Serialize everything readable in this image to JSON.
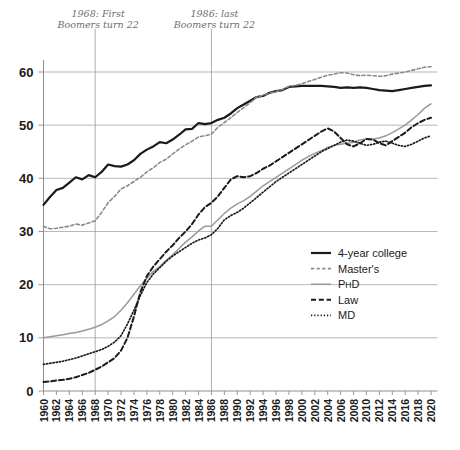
{
  "chart_data": {
    "type": "line",
    "title": "",
    "xlabel": "",
    "ylabel": "",
    "xlim": [
      1960,
      2021
    ],
    "ylim": [
      0,
      63
    ],
    "yticks": [
      0,
      10,
      20,
      30,
      40,
      50,
      60
    ],
    "grid": true,
    "legend_position": "center-right",
    "xticks": [
      1960,
      1962,
      1964,
      1966,
      1968,
      1970,
      1972,
      1974,
      1976,
      1978,
      1980,
      1982,
      1984,
      1986,
      1988,
      1990,
      1992,
      1994,
      1996,
      1998,
      2000,
      2002,
      2004,
      2006,
      2008,
      2010,
      2012,
      2014,
      2016,
      2018,
      2020
    ],
    "annotations": [
      {
        "text_line1": "1968: First",
        "text_line2": "Boomers turn 22",
        "x": 1968
      },
      {
        "text_line1": "1986: last",
        "text_line2": "Boomers turn 22",
        "x": 1986
      }
    ],
    "x": [
      1960,
      1961,
      1962,
      1963,
      1964,
      1965,
      1966,
      1967,
      1968,
      1969,
      1970,
      1971,
      1972,
      1973,
      1974,
      1975,
      1976,
      1977,
      1978,
      1979,
      1980,
      1981,
      1982,
      1983,
      1984,
      1985,
      1986,
      1987,
      1988,
      1989,
      1990,
      1991,
      1992,
      1993,
      1994,
      1995,
      1996,
      1997,
      1998,
      1999,
      2000,
      2001,
      2002,
      2003,
      2004,
      2005,
      2006,
      2007,
      2008,
      2009,
      2010,
      2011,
      2012,
      2013,
      2014,
      2015,
      2016,
      2017,
      2018,
      2019,
      2020
    ],
    "series": [
      {
        "name": "4-year college",
        "style": "solid",
        "color": "#1a1a1a",
        "width": 2.2,
        "values": [
          35.0,
          36.5,
          37.8,
          38.2,
          39.2,
          40.2,
          39.8,
          40.6,
          40.2,
          41.2,
          42.6,
          42.3,
          42.2,
          42.6,
          43.4,
          44.6,
          45.4,
          46.0,
          46.8,
          46.6,
          47.3,
          48.2,
          49.2,
          49.3,
          50.4,
          50.2,
          50.4,
          51.0,
          51.4,
          52.2,
          53.2,
          53.9,
          54.6,
          55.3,
          55.5,
          56.1,
          56.4,
          56.6,
          57.2,
          57.3,
          57.4,
          57.4,
          57.4,
          57.4,
          57.3,
          57.2,
          57.0,
          57.1,
          57.0,
          57.1,
          57.0,
          56.8,
          56.6,
          56.5,
          56.4,
          56.6,
          56.8,
          57.0,
          57.2,
          57.4,
          57.5
        ]
      },
      {
        "name": "Master's",
        "style": "dashed",
        "color": "#8a8a8a",
        "width": 1.6,
        "values": [
          31.0,
          30.5,
          30.6,
          30.8,
          31.0,
          31.4,
          31.2,
          31.6,
          32.0,
          33.6,
          35.4,
          36.6,
          38.0,
          38.6,
          39.4,
          40.2,
          41.2,
          42.0,
          43.0,
          43.6,
          44.6,
          45.5,
          46.3,
          47.0,
          47.8,
          48.0,
          48.3,
          49.6,
          50.5,
          51.4,
          52.4,
          53.3,
          54.2,
          55.3,
          55.6,
          56.0,
          56.3,
          56.7,
          57.3,
          57.5,
          57.8,
          58.2,
          58.6,
          59.0,
          59.4,
          59.6,
          59.9,
          59.8,
          59.5,
          59.3,
          59.4,
          59.3,
          59.2,
          59.3,
          59.6,
          59.8,
          60.0,
          60.3,
          60.6,
          60.9,
          61.0
        ]
      },
      {
        "name": "PhD",
        "style": "solid",
        "color": "#9a9a9a",
        "width": 1.5,
        "values": [
          10.0,
          10.2,
          10.4,
          10.6,
          10.8,
          11.0,
          11.3,
          11.6,
          12.0,
          12.5,
          13.2,
          14.0,
          15.2,
          16.6,
          18.2,
          19.8,
          21.2,
          22.5,
          23.4,
          24.6,
          25.6,
          26.8,
          28.0,
          29.0,
          30.1,
          31.0,
          31.0,
          32.2,
          33.4,
          34.4,
          35.2,
          35.8,
          36.6,
          37.6,
          38.6,
          39.4,
          40.2,
          41.0,
          41.8,
          42.6,
          43.4,
          44.1,
          44.7,
          45.2,
          45.8,
          46.2,
          46.4,
          46.6,
          46.8,
          47.2,
          47.4,
          47.4,
          47.6,
          48.0,
          48.6,
          49.3,
          50.0,
          51.0,
          52.0,
          53.2,
          54.0
        ]
      },
      {
        "name": "Law",
        "style": "dashed-heavy",
        "color": "#1a1a1a",
        "width": 2.0,
        "values": [
          1.7,
          1.8,
          2.0,
          2.1,
          2.3,
          2.6,
          3.0,
          3.4,
          4.0,
          4.6,
          5.4,
          6.2,
          7.6,
          10.0,
          14.0,
          18.6,
          21.6,
          23.4,
          24.8,
          26.2,
          27.4,
          28.8,
          30.0,
          31.4,
          33.2,
          34.6,
          35.4,
          36.6,
          38.2,
          39.8,
          40.4,
          40.2,
          40.4,
          41.0,
          41.8,
          42.4,
          43.2,
          44.0,
          44.8,
          45.6,
          46.4,
          47.2,
          48.0,
          48.8,
          49.4,
          48.8,
          47.6,
          46.4,
          46.0,
          46.6,
          47.4,
          47.3,
          46.6,
          46.2,
          47.0,
          47.8,
          48.6,
          49.6,
          50.4,
          51.0,
          51.4
        ]
      },
      {
        "name": "MD",
        "style": "dotted",
        "color": "#1a1a1a",
        "width": 1.7,
        "values": [
          5.0,
          5.2,
          5.4,
          5.6,
          5.9,
          6.2,
          6.6,
          7.0,
          7.4,
          7.8,
          8.4,
          9.2,
          10.4,
          12.6,
          15.2,
          18.0,
          20.4,
          22.0,
          23.2,
          24.4,
          25.4,
          26.2,
          27.0,
          27.8,
          28.4,
          28.8,
          29.4,
          30.6,
          32.2,
          33.0,
          33.6,
          34.4,
          35.4,
          36.4,
          37.4,
          38.4,
          39.4,
          40.2,
          41.0,
          41.8,
          42.6,
          43.4,
          44.2,
          45.0,
          45.6,
          46.2,
          46.8,
          47.2,
          47.0,
          46.6,
          46.2,
          46.4,
          46.8,
          47.0,
          46.6,
          46.2,
          46.0,
          46.4,
          47.0,
          47.6,
          48.0
        ]
      }
    ]
  },
  "legend": {
    "items": [
      {
        "label": "4-year college",
        "swatch": "solid-black"
      },
      {
        "label": "Master's",
        "swatch": "dashed-gray"
      },
      {
        "label": "PhD",
        "swatch": "solid-gray",
        "label_main": "P",
        "label_small": "H",
        "label_tail": "D"
      },
      {
        "label": "Law",
        "swatch": "dashed-black"
      },
      {
        "label": "MD",
        "swatch": "dotted-black"
      }
    ]
  },
  "colors": {
    "axis": "#8d8d8d",
    "grid": "#9a9a9a",
    "text": "#1a1a1a",
    "annotation": "#6e6e6e",
    "series_dark": "#1a1a1a",
    "series_gray": "#9a9a9a"
  }
}
